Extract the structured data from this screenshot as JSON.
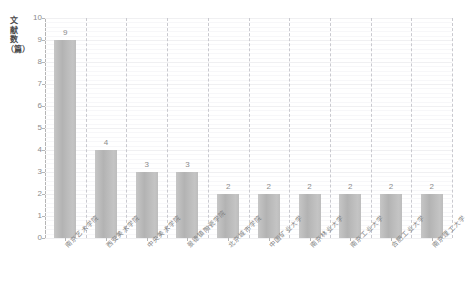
{
  "chart_data": {
    "type": "bar",
    "title": "",
    "xlabel": "",
    "ylabel": "文献数（篇）",
    "ylim": [
      0,
      10
    ],
    "yticks": [
      0,
      1,
      2,
      3,
      4,
      5,
      6,
      7,
      8,
      9,
      10
    ],
    "grid": true,
    "legend": null,
    "categories": [
      "南京艺术学院",
      "西安美术学院",
      "中央美术学院",
      "景德镇陶瓷学院",
      "北京城市学院",
      "中国矿业大学",
      "南京林业大学",
      "南京工业大学",
      "合肥工业大学",
      "南京理工大学"
    ],
    "values": [
      9,
      4,
      3,
      3,
      2,
      2,
      2,
      2,
      2,
      2
    ],
    "value_labels": [
      "9",
      "4",
      "3",
      "3",
      "2",
      "2",
      "2",
      "2",
      "2",
      "2"
    ],
    "bar_color": "#bdbdbd",
    "axis_color": "#b5b5b5",
    "grid_color": "#f0f0f2",
    "separator_color": "#c9c9cf",
    "text_color": "#8c8c8c"
  }
}
